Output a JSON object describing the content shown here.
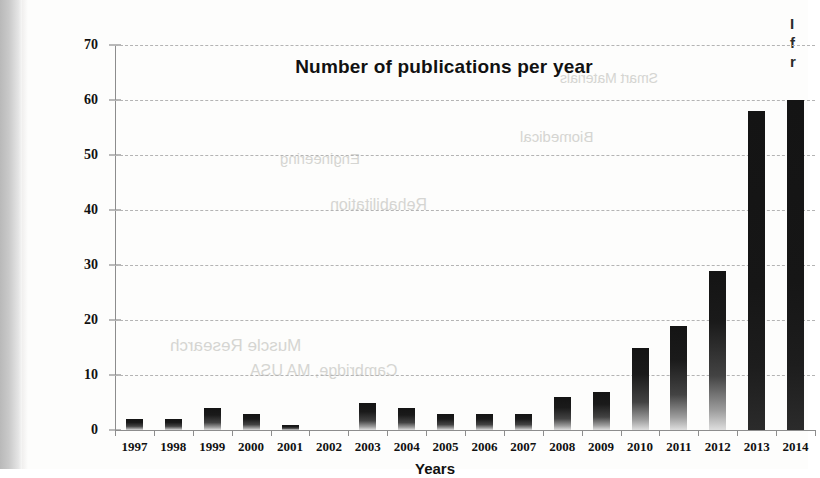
{
  "chart_data": {
    "type": "bar",
    "title": "Number of publications per year",
    "xlabel": "Years",
    "ylabel": "",
    "ylim": [
      0,
      70
    ],
    "ytick_step": 10,
    "grid": true,
    "legend": "none",
    "bar_color": "#141414",
    "categories": [
      "1997",
      "1998",
      "1999",
      "2000",
      "2001",
      "2002",
      "2003",
      "2004",
      "2005",
      "2006",
      "2007",
      "2008",
      "2009",
      "2010",
      "2011",
      "2012",
      "2013",
      "2014"
    ],
    "values": [
      2,
      2,
      4,
      3,
      1,
      0,
      5,
      4,
      3,
      3,
      3,
      6,
      7,
      15,
      19,
      29,
      58,
      60
    ],
    "ytick_labels": [
      "0",
      "10",
      "20",
      "30",
      "40",
      "50",
      "60",
      "70"
    ]
  },
  "axes": {
    "y_ticks": [
      0,
      10,
      20,
      30,
      40,
      50,
      60,
      70
    ]
  },
  "scan": {
    "margin_bleed_line1": "I",
    "margin_bleed_line2": "f",
    "margin_bleed_line3": "r",
    "bleed_texts": [
      "Smart Materials",
      "Biomedical",
      "Engineering",
      "Rehabilitation",
      "Muscle Research",
      "Cambridge, MA USA"
    ]
  }
}
